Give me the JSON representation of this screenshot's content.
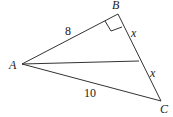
{
  "diagram": {
    "type": "triangle",
    "points": {
      "A": {
        "label": "A",
        "x": 22,
        "y": 64
      },
      "B": {
        "label": "B",
        "x": 118,
        "y": 14
      },
      "C": {
        "label": "C",
        "x": 161,
        "y": 101
      },
      "M": {
        "x": 139,
        "y": 61
      }
    },
    "edge_labels": {
      "AB": "8",
      "BM": "x",
      "MC": "x",
      "AC": "10"
    },
    "right_angle_at": "B",
    "median": "AM"
  }
}
